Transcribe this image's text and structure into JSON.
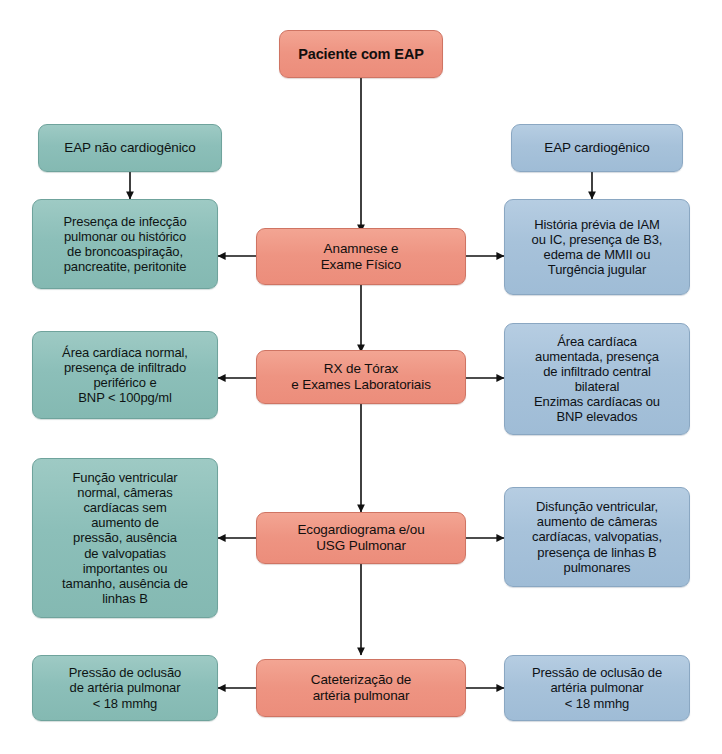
{
  "diagram": {
    "colors": {
      "center": "#ee9482",
      "left_branch": "#8cbfb9",
      "right_branch": "#a7c2da",
      "arrow": "#111111",
      "background": "#ffffff"
    },
    "nodes": {
      "root": "Paciente com EAP",
      "left_header": "EAP não cardiogênico",
      "right_header": "EAP cardiogênico",
      "step1_center": "Anamnese e\nExame Físico",
      "step1_left": "Presença de infecção\npulmonar ou histórico\nde broncoaspiração,\npancreatite, peritonite",
      "step1_right": "História prévia de IAM\nou IC, presença de B3,\nedema de MMII ou\nTurgência jugular",
      "step2_center": "RX de Tórax\ne Exames Laboratoriais",
      "step2_left": "Área cardíaca normal,\npresença de infiltrado\nperiférico e\nBNP < 100pg/ml",
      "step2_right": "Área cardíaca\naumentada, presença\nde infiltrado central\nbilateral\nEnzimas cardíacas ou\nBNP elevados",
      "step3_center": "Ecogardiograma e/ou\nUSG Pulmonar",
      "step3_left": "Função ventricular\nnormal, câmeras\ncardíacas sem\naumento de\npressão, ausência\nde valvopatias\nimportantes ou\ntamanho, ausência de\nlinhas B",
      "step3_right": "Disfunção ventricular,\naumento de câmeras\ncardíacas, valvopatias,\npresença de linhas B\npulmonares",
      "step4_center": "Cateterização de\nartéria pulmonar",
      "step4_left": "Pressão de oclusão\nde artéria pulmonar\n< 18 mmhg",
      "step4_right": "Pressão de oclusão de\nartéria pulmonar\n< 18 mmhg"
    },
    "edges": [
      {
        "from": "root",
        "to": "step1_center",
        "direction": "down"
      },
      {
        "from": "left_header",
        "to": "step1_left",
        "direction": "down"
      },
      {
        "from": "right_header",
        "to": "step1_right",
        "direction": "down"
      },
      {
        "from": "step1_center",
        "to": "step1_left",
        "direction": "left"
      },
      {
        "from": "step1_center",
        "to": "step1_right",
        "direction": "right"
      },
      {
        "from": "step1_center",
        "to": "step2_center",
        "direction": "down"
      },
      {
        "from": "step2_center",
        "to": "step2_left",
        "direction": "left"
      },
      {
        "from": "step2_center",
        "to": "step2_right",
        "direction": "right"
      },
      {
        "from": "step2_center",
        "to": "step3_center",
        "direction": "down"
      },
      {
        "from": "step3_center",
        "to": "step3_left",
        "direction": "left"
      },
      {
        "from": "step3_center",
        "to": "step3_right",
        "direction": "right"
      },
      {
        "from": "step3_center",
        "to": "step4_center",
        "direction": "down"
      },
      {
        "from": "step4_center",
        "to": "step4_left",
        "direction": "left"
      },
      {
        "from": "step4_center",
        "to": "step4_right",
        "direction": "right"
      }
    ]
  }
}
